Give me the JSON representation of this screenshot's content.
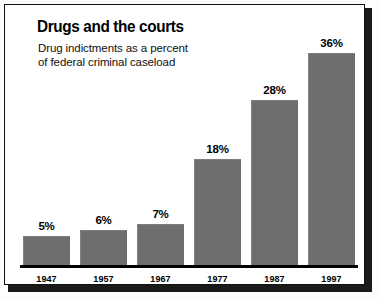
{
  "chart_data": {
    "type": "bar",
    "title": "Drugs and the courts",
    "subtitle": "Drug indictments as a percent\nof federal criminal caseload",
    "categories": [
      "1947",
      "1957",
      "1967",
      "1977",
      "1987",
      "1997"
    ],
    "values": [
      5,
      6,
      7,
      18,
      28,
      36
    ],
    "value_labels": [
      "5%",
      "6%",
      "7%",
      "18%",
      "28%",
      "36%"
    ],
    "xlabel": "",
    "ylabel": "",
    "ylim": [
      0,
      36
    ],
    "grid": false,
    "legend": false,
    "bar_color": "#6e6e6e",
    "text_color": "#000000",
    "background_color": "#ffffff",
    "frame_color": "#111111"
  }
}
